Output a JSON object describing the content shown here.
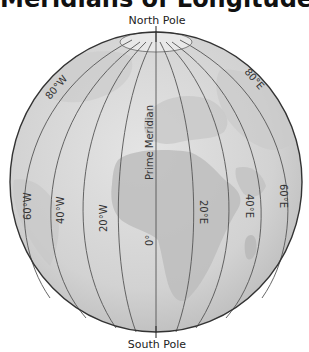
{
  "title": "Meridians of Longitude",
  "poles": {
    "north": "North Pole",
    "south": "South Pole"
  },
  "prime_meridian_label": "Prime Meridian",
  "meridian_labels": {
    "w80": "80°W",
    "w60": "60°W",
    "w40": "40°W",
    "w20": "20°W",
    "zero": "0°",
    "e20": "20°E",
    "e40": "40°E",
    "e60": "60°E",
    "e80": "80°E"
  },
  "colors": {
    "ocean": "#d9d9d9",
    "land": "#bdbdbd",
    "line": "#555555",
    "outline": "#333333"
  }
}
